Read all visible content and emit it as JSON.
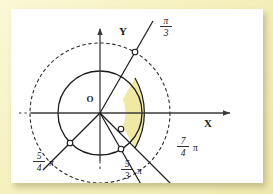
{
  "figure": {
    "type": "polar-diagram",
    "title_visible": false,
    "background_color": "#f7f2c4",
    "panel_color": "#ffffff",
    "shade_color": "#f0e9a6",
    "stroke_color": "#1a1a1a",
    "axes": {
      "x_label": "X",
      "y_label": "Y",
      "origin_label": "O"
    },
    "angle_labels": [
      {
        "id": "pi-over-3",
        "numerator": "π",
        "denominator": "3",
        "trailing": "",
        "angle_deg": 60
      },
      {
        "id": "five-fourths-pi",
        "numerator": "5",
        "denominator": "4",
        "trailing": "π",
        "angle_deg": 225
      },
      {
        "id": "five-thirds-pi",
        "numerator": "5",
        "denominator": "3",
        "trailing": "π",
        "angle_deg": 300
      },
      {
        "id": "seven-fourths-pi",
        "numerator": "7",
        "denominator": "4",
        "trailing": "π",
        "angle_deg": 315
      }
    ],
    "circles": [
      {
        "id": "inner-circle",
        "style": "solid",
        "radius": 42
      },
      {
        "id": "outer-circle",
        "style": "dashed",
        "radius": 70
      },
      {
        "id": "shade-outer-arc",
        "style": "solid",
        "radius": 70
      }
    ],
    "markers": [
      {
        "id": "marker-pi-over-3",
        "on": "outer-circle",
        "angle_deg": 60
      },
      {
        "id": "marker-five-fourths-pi",
        "on": "inner-circle",
        "angle_deg": 225
      },
      {
        "id": "marker-five-thirds-pi-inner",
        "on": "inner-circle",
        "angle_deg": 300
      },
      {
        "id": "marker-five-thirds-pi-outer",
        "on": "outer-circle",
        "angle_deg": 300
      }
    ],
    "shaded_sector": {
      "start_angle_deg": 60,
      "end_angle_deg": -60,
      "inner_radius": 42,
      "outer_radius": 70
    }
  }
}
